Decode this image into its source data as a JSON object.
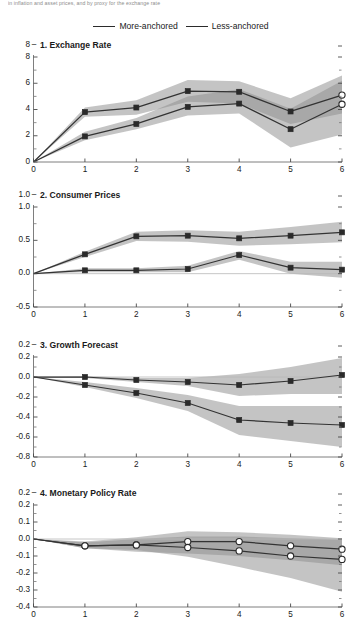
{
  "header": {
    "note": "in inflation and asset prices, and by proxy for the exchange rate"
  },
  "legend": {
    "position": "top-center",
    "entries": [
      {
        "label": "More-anchored",
        "color": "#2b2b2b"
      },
      {
        "label": "Less-anchored",
        "color": "#2b2b2b"
      }
    ]
  },
  "chart_data": [
    {
      "type": "line",
      "title": "1. Exchange Rate",
      "xlabel": "",
      "ylabel": "",
      "x": [
        0,
        1,
        2,
        3,
        4,
        5,
        6
      ],
      "xlim": [
        0,
        6
      ],
      "ylim": [
        0,
        8
      ],
      "xticks": [
        "0",
        "1",
        "2",
        "3",
        "4",
        "5",
        "6"
      ],
      "yticks": [
        "0",
        "2",
        "4",
        "6",
        "8"
      ],
      "ytick_values": [
        0,
        2,
        4,
        6,
        8
      ],
      "minor_ytick_values": [
        1,
        3,
        5,
        7
      ],
      "grid": false,
      "marker": "square",
      "last_marker": "circle",
      "series": [
        {
          "name": "More-anchored",
          "values": [
            0,
            3.8,
            4.15,
            5.4,
            5.35,
            3.85,
            5.1
          ],
          "band_lower": [
            0,
            3.45,
            3.6,
            4.6,
            4.45,
            2.9,
            3.7
          ],
          "band_upper": [
            0,
            4.15,
            4.7,
            6.25,
            6.15,
            4.85,
            6.6
          ]
        },
        {
          "name": "Less-anchored",
          "values": [
            0,
            1.95,
            2.9,
            4.2,
            4.45,
            2.5,
            4.4
          ],
          "band_lower": [
            0,
            1.65,
            2.5,
            3.55,
            3.7,
            1.1,
            2.1
          ],
          "band_upper": [
            0,
            2.3,
            3.35,
            5.0,
            5.55,
            4.05,
            6.2
          ]
        }
      ]
    },
    {
      "type": "line",
      "title": "2. Consumer Prices",
      "xlabel": "",
      "ylabel": "",
      "x": [
        0,
        1,
        2,
        3,
        4,
        5,
        6
      ],
      "xlim": [
        0,
        6
      ],
      "ylim": [
        -0.5,
        1.0
      ],
      "xticks": [
        "0",
        "1",
        "2",
        "3",
        "4",
        "5",
        "6"
      ],
      "yticks": [
        "-0.5",
        "0.0",
        "0.5",
        "1.0"
      ],
      "ytick_values": [
        -0.5,
        0.0,
        0.5,
        1.0
      ],
      "minor_ytick_values": [
        -0.25,
        0.25,
        0.75
      ],
      "grid": false,
      "marker": "square",
      "last_marker": "square",
      "series": [
        {
          "name": "More-anchored",
          "values": [
            0.0,
            0.29,
            0.56,
            0.57,
            0.53,
            0.57,
            0.62
          ],
          "band_lower": [
            0.0,
            0.25,
            0.49,
            0.48,
            0.42,
            0.44,
            0.47
          ],
          "band_upper": [
            0.0,
            0.33,
            0.63,
            0.65,
            0.63,
            0.7,
            0.78
          ]
        },
        {
          "name": "Less-anchored",
          "values": [
            0.0,
            0.05,
            0.05,
            0.07,
            0.28,
            0.09,
            0.06
          ],
          "band_lower": [
            0.0,
            0.02,
            0.02,
            0.02,
            0.21,
            0.0,
            -0.06
          ],
          "band_upper": [
            0.0,
            0.08,
            0.08,
            0.12,
            0.34,
            0.18,
            0.18
          ]
        }
      ]
    },
    {
      "type": "line",
      "title": "3. Growth Forecast",
      "xlabel": "",
      "ylabel": "",
      "x": [
        0,
        1,
        2,
        3,
        4,
        5,
        6
      ],
      "xlim": [
        0,
        6
      ],
      "ylim": [
        -0.8,
        0.2
      ],
      "xticks": [
        "0",
        "1",
        "2",
        "3",
        "4",
        "5",
        "6"
      ],
      "yticks": [
        "-0.8",
        "-0.6",
        "-0.4",
        "-0.2",
        "0.0",
        "0.2"
      ],
      "ytick_values": [
        -0.8,
        -0.6,
        -0.4,
        -0.2,
        0.0,
        0.2
      ],
      "minor_ytick_values": [
        -0.7,
        -0.5,
        -0.3,
        -0.1,
        0.1
      ],
      "grid": false,
      "marker": "square",
      "last_marker": "square",
      "series": [
        {
          "name": "More-anchored",
          "values": [
            0.0,
            0.0,
            -0.03,
            -0.05,
            -0.08,
            -0.04,
            0.02
          ],
          "band_lower": [
            0.0,
            -0.01,
            -0.05,
            -0.09,
            -0.19,
            -0.17,
            -0.17
          ],
          "band_upper": [
            0.0,
            0.01,
            -0.01,
            -0.01,
            0.03,
            0.1,
            0.19
          ]
        },
        {
          "name": "Less-anchored",
          "values": [
            0.0,
            -0.08,
            -0.16,
            -0.26,
            -0.43,
            -0.46,
            -0.48
          ],
          "band_lower": [
            0.0,
            -0.1,
            -0.21,
            -0.34,
            -0.58,
            -0.64,
            -0.7
          ],
          "band_upper": [
            0.0,
            -0.05,
            -0.11,
            -0.18,
            -0.29,
            -0.29,
            -0.29
          ]
        }
      ]
    },
    {
      "type": "line",
      "title": "4. Monetary Policy Rate",
      "xlabel": "",
      "ylabel": "",
      "x": [
        0,
        1,
        2,
        3,
        4,
        5,
        6
      ],
      "xlim": [
        0,
        6
      ],
      "ylim": [
        -0.4,
        0.2
      ],
      "xticks": [
        "0",
        "1",
        "2",
        "3",
        "4",
        "5",
        "6"
      ],
      "yticks": [
        "-0.4",
        "-0.3",
        "-0.2",
        "-0.1",
        "0.0",
        "0.1",
        "0.2"
      ],
      "ytick_values": [
        -0.4,
        -0.3,
        -0.2,
        -0.1,
        0.0,
        0.1,
        0.2
      ],
      "minor_ytick_values": [
        -0.35,
        -0.25,
        -0.15,
        -0.05,
        0.05,
        0.15
      ],
      "grid": false,
      "marker": "circle",
      "last_marker": "circle",
      "series": [
        {
          "name": "More-anchored",
          "values": [
            0.0,
            -0.04,
            -0.035,
            -0.015,
            -0.015,
            -0.04,
            -0.06
          ],
          "band_lower": [
            0.0,
            -0.055,
            -0.075,
            -0.085,
            -0.1,
            -0.125,
            -0.155
          ],
          "band_upper": [
            0.0,
            -0.015,
            0.01,
            0.045,
            0.04,
            0.025,
            0.005
          ]
        },
        {
          "name": "Less-anchored",
          "values": [
            0.0,
            -0.04,
            -0.035,
            -0.05,
            -0.07,
            -0.1,
            -0.12
          ],
          "band_lower": [
            0.0,
            -0.055,
            -0.065,
            -0.105,
            -0.165,
            -0.23,
            -0.31
          ],
          "band_upper": [
            0.0,
            -0.02,
            0.0,
            0.015,
            0.015,
            0.005,
            -0.005
          ]
        }
      ]
    }
  ]
}
